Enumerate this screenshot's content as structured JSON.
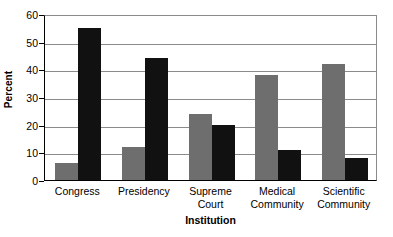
{
  "chart_data": {
    "type": "bar",
    "title": "",
    "xlabel": "Institution",
    "ylabel": "Percent",
    "categories": [
      "Congress",
      "Presidency",
      "Supreme\nCourt",
      "Medical\nCommunity",
      "Scientific\nCommunity"
    ],
    "series": [
      {
        "name": "series-a",
        "color": "#6e6e6e",
        "values": [
          6,
          12,
          24,
          38,
          42
        ]
      },
      {
        "name": "series-b",
        "color": "#111111",
        "values": [
          55,
          44,
          20,
          11,
          8
        ]
      }
    ],
    "ylim": [
      0,
      60
    ],
    "yticks": [
      0,
      10,
      20,
      30,
      40,
      50,
      60
    ],
    "ytick_labels": [
      "0",
      "10",
      "20",
      "30",
      "40",
      "50",
      "60"
    ],
    "grid": true,
    "legend": "none"
  },
  "colors": {
    "series_a": "#6e6e6e",
    "series_b": "#111111",
    "gridline": "#8b8b8b",
    "axis": "#000000",
    "background": "#ffffff"
  }
}
